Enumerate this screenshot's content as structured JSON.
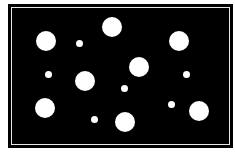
{
  "colors": {
    "background": "#000000",
    "dot": "#ffffff",
    "frame_line": "#e8e8e8",
    "page": "#ffffff"
  },
  "dots": [
    {
      "cx": 46,
      "cy": 41,
      "r": 10,
      "size": "large"
    },
    {
      "cx": 112,
      "cy": 27,
      "r": 10,
      "size": "large"
    },
    {
      "cx": 179,
      "cy": 41,
      "r": 10,
      "size": "large"
    },
    {
      "cx": 79,
      "cy": 43,
      "r": 3.5,
      "size": "small"
    },
    {
      "cx": 48,
      "cy": 74,
      "r": 3.5,
      "size": "small"
    },
    {
      "cx": 85,
      "cy": 81,
      "r": 10,
      "size": "large"
    },
    {
      "cx": 139,
      "cy": 67,
      "r": 10,
      "size": "large"
    },
    {
      "cx": 186,
      "cy": 74,
      "r": 3.5,
      "size": "small"
    },
    {
      "cx": 124,
      "cy": 88,
      "r": 3.5,
      "size": "small"
    },
    {
      "cx": 45,
      "cy": 108,
      "r": 10,
      "size": "large"
    },
    {
      "cx": 94,
      "cy": 119,
      "r": 3.5,
      "size": "small"
    },
    {
      "cx": 125,
      "cy": 122,
      "r": 10,
      "size": "large"
    },
    {
      "cx": 171,
      "cy": 104,
      "r": 3.5,
      "size": "small"
    },
    {
      "cx": 199,
      "cy": 111,
      "r": 10,
      "size": "large"
    }
  ]
}
